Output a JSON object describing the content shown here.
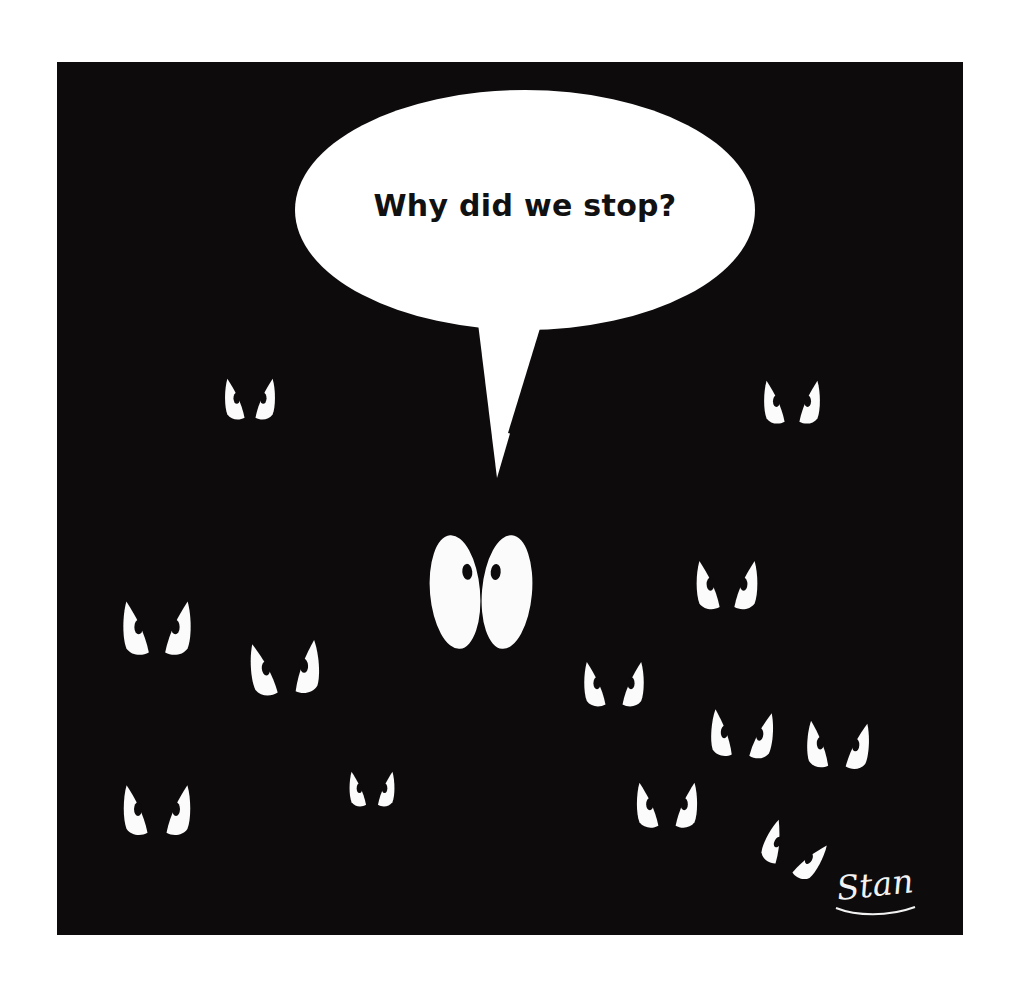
{
  "comic": {
    "title": "Why did we stop?",
    "panel": {
      "background_color": "#0d0b0b",
      "x": 57,
      "y": 62,
      "width": 906,
      "height": 873
    },
    "page_background_color": "#ffffff",
    "speech_bubble": {
      "text": "Why did we stop?",
      "fill_color": "#ffffff",
      "text_color": "#111111",
      "center_x": 525,
      "center_y": 210,
      "radius_x": 230,
      "radius_y": 120,
      "tail_tip_x": 497,
      "tail_tip_y": 478
    },
    "signature": {
      "text": "Stan",
      "color": "#f2f2f2",
      "x": 838,
      "y": 900
    },
    "eye_color": "#fbfbfb",
    "pupil_color": "#0d0b0b",
    "eye_pair_count": 14,
    "eye_pairs": [
      {
        "id": "speaker-eyes",
        "label": "large-innocent-eyes",
        "type": "wide",
        "cx": 481,
        "cy": 592
      },
      {
        "id": "eyes-upper-left",
        "label": "angry-eyes-upper-left",
        "type": "angry",
        "cx": 250,
        "cy": 399
      },
      {
        "id": "eyes-upper-right",
        "label": "angry-eyes-upper-right",
        "type": "angry",
        "cx": 792,
        "cy": 402
      },
      {
        "id": "eyes-mid-left",
        "label": "angry-eyes-mid-left",
        "type": "angry",
        "cx": 157,
        "cy": 628
      },
      {
        "id": "eyes-lower-left",
        "label": "angry-eyes-lower-left",
        "type": "angry",
        "cx": 285,
        "cy": 668
      },
      {
        "id": "eyes-right-upper",
        "label": "angry-eyes-right-upper",
        "type": "angry",
        "cx": 727,
        "cy": 585
      },
      {
        "id": "eyes-center-low",
        "label": "angry-eyes-center-low",
        "type": "angry",
        "cx": 614,
        "cy": 684
      },
      {
        "id": "eyes-right-mid",
        "label": "angry-eyes-right-mid",
        "type": "angry",
        "cx": 742,
        "cy": 734
      },
      {
        "id": "eyes-far-right",
        "label": "angry-eyes-far-right",
        "type": "angry",
        "cx": 838,
        "cy": 745
      },
      {
        "id": "eyes-bottom-left",
        "label": "angry-eyes-bottom-left",
        "type": "angry",
        "cx": 157,
        "cy": 810
      },
      {
        "id": "eyes-bottom-center-left",
        "label": "angry-eyes-bottom-center-left",
        "type": "angry",
        "cx": 372,
        "cy": 789
      },
      {
        "id": "eyes-bottom-center-right",
        "label": "angry-eyes-bottom-center-right",
        "type": "angry",
        "cx": 667,
        "cy": 805
      },
      {
        "id": "eyes-bottom-right",
        "label": "angry-eyes-bottom-right",
        "type": "angry",
        "cx": 793,
        "cy": 851
      }
    ]
  }
}
